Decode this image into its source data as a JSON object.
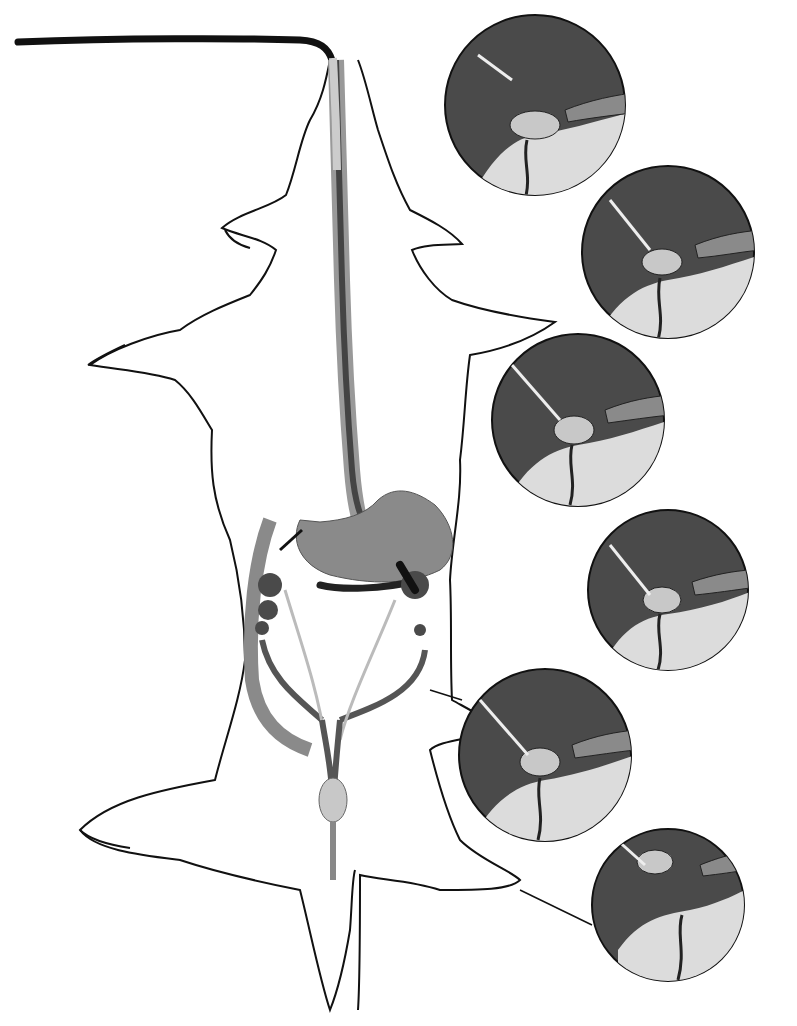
{
  "figure": {
    "title": "",
    "colors": {
      "outline": "#111111",
      "dark_fill": "#4a4a4a",
      "mid_fill": "#8a8a8a",
      "light_fill": "#c8c8c8",
      "pale_fill": "#dcdcdc",
      "background": "#ffffff"
    },
    "insets": [
      {
        "step": 1,
        "cx": 535,
        "cy": 105,
        "r": 92
      },
      {
        "step": 2,
        "cx": 668,
        "cy": 252,
        "r": 88
      },
      {
        "step": 3,
        "cx": 578,
        "cy": 420,
        "r": 88
      },
      {
        "step": 4,
        "cx": 668,
        "cy": 590,
        "r": 82
      },
      {
        "step": 5,
        "cx": 545,
        "cy": 755,
        "r": 88
      },
      {
        "step": 6,
        "cx": 668,
        "cy": 905,
        "r": 78
      }
    ]
  }
}
